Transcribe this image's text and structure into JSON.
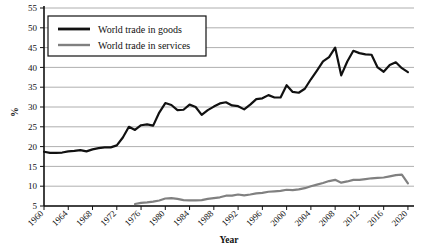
{
  "chart_data": {
    "type": "line",
    "title": "",
    "xlabel": "Year",
    "ylabel": "%",
    "xlim": [
      1960,
      2021
    ],
    "ylim": [
      5,
      55
    ],
    "grid": true,
    "legend_position": "top-left",
    "xticks": [
      1960,
      1964,
      1968,
      1972,
      1976,
      1980,
      1984,
      1988,
      1992,
      1996,
      2000,
      2004,
      2008,
      2012,
      2016,
      2020
    ],
    "yticks": [
      5,
      10,
      15,
      20,
      25,
      30,
      35,
      40,
      45,
      50,
      55
    ],
    "colors": {
      "goods": "#111111",
      "services": "#808080",
      "grid": "#9a9a9a",
      "axis": "#111111"
    },
    "series": [
      {
        "name": "World trade in goods",
        "color": "#111111",
        "x": [
          1960,
          1961,
          1962,
          1963,
          1964,
          1965,
          1966,
          1967,
          1968,
          1969,
          1970,
          1971,
          1972,
          1973,
          1974,
          1975,
          1976,
          1977,
          1978,
          1979,
          1980,
          1981,
          1982,
          1983,
          1984,
          1985,
          1986,
          1987,
          1988,
          1989,
          1990,
          1991,
          1992,
          1993,
          1994,
          1995,
          1996,
          1997,
          1998,
          1999,
          2000,
          2001,
          2002,
          2003,
          2004,
          2005,
          2006,
          2007,
          2008,
          2009,
          2010,
          2011,
          2012,
          2013,
          2014,
          2015,
          2016,
          2017,
          2018,
          2019,
          2020
        ],
        "values": [
          18.7,
          18.4,
          18.4,
          18.5,
          18.8,
          18.9,
          19.1,
          18.8,
          19.3,
          19.6,
          19.8,
          19.8,
          20.3,
          22.3,
          25.0,
          24.2,
          25.4,
          25.6,
          25.3,
          28.6,
          31.0,
          30.5,
          29.2,
          29.3,
          30.6,
          30.0,
          28.0,
          29.2,
          30.1,
          30.9,
          31.2,
          30.4,
          30.2,
          29.4,
          30.6,
          32.0,
          32.2,
          33.0,
          32.4,
          32.4,
          35.5,
          33.8,
          33.6,
          34.6,
          37.0,
          39.2,
          41.5,
          42.6,
          45.0,
          38.0,
          41.5,
          44.2,
          43.6,
          43.3,
          43.2,
          40.0,
          38.9,
          40.6,
          41.3,
          39.8,
          38.8
        ]
      },
      {
        "name": "World trade in services",
        "color": "#808080",
        "x": [
          1975,
          1976,
          1977,
          1978,
          1979,
          1980,
          1981,
          1982,
          1983,
          1984,
          1985,
          1986,
          1987,
          1988,
          1989,
          1990,
          1991,
          1992,
          1993,
          1994,
          1995,
          1996,
          1997,
          1998,
          1999,
          2000,
          2001,
          2002,
          2003,
          2004,
          2005,
          2006,
          2007,
          2008,
          2009,
          2010,
          2011,
          2012,
          2013,
          2014,
          2015,
          2016,
          2017,
          2018,
          2019,
          2020
        ],
        "values": [
          5.5,
          5.8,
          5.9,
          6.1,
          6.4,
          6.9,
          7.0,
          6.8,
          6.5,
          6.4,
          6.4,
          6.5,
          6.8,
          7.0,
          7.2,
          7.6,
          7.6,
          7.9,
          7.7,
          7.9,
          8.2,
          8.3,
          8.6,
          8.7,
          8.8,
          9.1,
          9.0,
          9.2,
          9.5,
          10.0,
          10.4,
          10.8,
          11.3,
          11.6,
          10.9,
          11.2,
          11.6,
          11.6,
          11.8,
          12.0,
          12.1,
          12.2,
          12.5,
          12.8,
          12.9,
          10.7
        ]
      }
    ]
  },
  "legend": {
    "items": [
      {
        "label": "World trade in goods"
      },
      {
        "label": "World trade in services"
      }
    ]
  }
}
